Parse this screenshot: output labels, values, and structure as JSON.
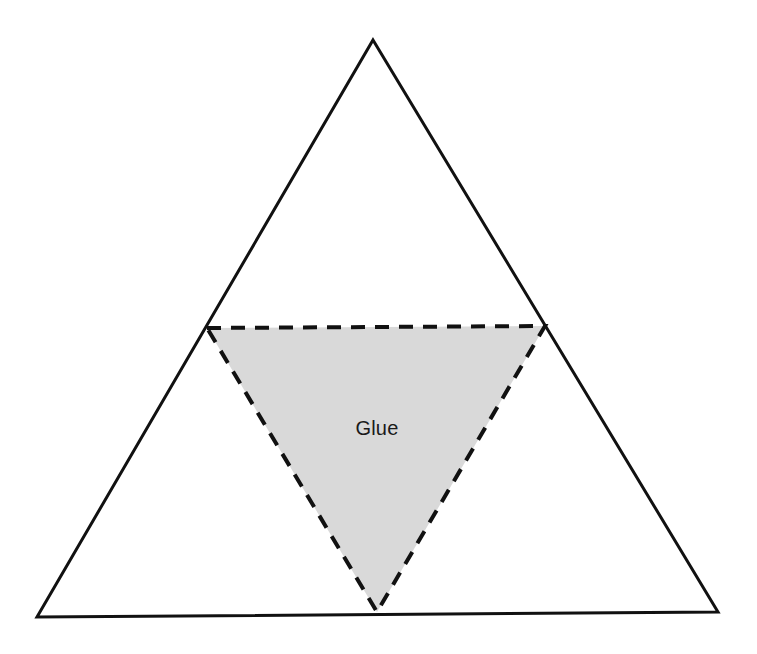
{
  "canvas": {
    "width": 757,
    "height": 654,
    "background_color": "#ffffff"
  },
  "diagram": {
    "outer_shape": {
      "name": "outer-triangle",
      "stroke_color": "#111111",
      "stroke_width": 3,
      "stroke_style": "solid",
      "fill": "none",
      "points": "373,40 718,612 37,617",
      "vertices": [
        {
          "label": "apex",
          "x": 373,
          "y": 40
        },
        {
          "label": "bottom-right",
          "x": 718,
          "y": 612
        },
        {
          "label": "bottom-left",
          "x": 37,
          "y": 617
        }
      ]
    },
    "inner_shape": {
      "name": "glue-triangle",
      "stroke_color": "#111111",
      "stroke_width": 4,
      "stroke_style": "dashed",
      "dash_pattern": "14 10",
      "fill_color": "#d9d9d9",
      "points": "207,328 545,326 377,612",
      "vertices": [
        {
          "label": "top-left",
          "x": 207,
          "y": 328
        },
        {
          "label": "top-right",
          "x": 545,
          "y": 326
        },
        {
          "label": "bottom",
          "x": 377,
          "y": 612
        }
      ]
    },
    "labels": [
      {
        "name": "glue-label",
        "text": "Glue",
        "x": 377,
        "y": 430,
        "font_size": 20,
        "color": "#1a1a1a"
      }
    ]
  }
}
